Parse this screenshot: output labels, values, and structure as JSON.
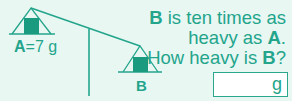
{
  "question": {
    "line1_bold": "B",
    "line1_rest": " is ten times as",
    "line2_pre": "heavy as ",
    "line2_bold": "A",
    "line2_post": ".",
    "line3_pre": "How heavy is ",
    "line3_bold": "B",
    "line3_post": "?"
  },
  "scale": {
    "left_label_bold": "A",
    "left_label_rest": "=7 g",
    "right_label": "B"
  },
  "answer": {
    "value": "",
    "placeholder": "",
    "unit": "g"
  },
  "colors": {
    "background": "#e9f7f3",
    "accent": "#23a58c",
    "weight_fill": "#1a9a7e"
  }
}
